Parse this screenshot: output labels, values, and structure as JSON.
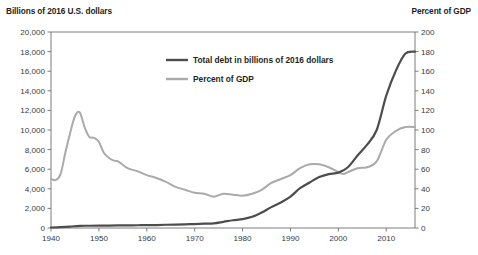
{
  "chart_data": {
    "type": "line",
    "title": "",
    "left_axis_title": "Billions of 2016 U.S. dollars",
    "right_axis_title": "Percent of GDP",
    "xlabel": "",
    "xlim": [
      1940,
      2016
    ],
    "x_ticks": [
      "1940",
      "1950",
      "1960",
      "1970",
      "1980",
      "1990",
      "2000",
      "2010"
    ],
    "x_tick_values": [
      1940,
      1950,
      1960,
      1970,
      1980,
      1990,
      2000,
      2010
    ],
    "left_ylim": [
      0,
      20000
    ],
    "left_ticks": [
      "0",
      "2,000",
      "4,000",
      "6,000",
      "8,000",
      "10,000",
      "12,000",
      "14,000",
      "16,000",
      "18,000",
      "20,000"
    ],
    "left_tick_values": [
      0,
      2000,
      4000,
      6000,
      8000,
      10000,
      12000,
      14000,
      16000,
      18000,
      20000
    ],
    "right_ylim": [
      0,
      200
    ],
    "right_ticks": [
      "0",
      "20",
      "40",
      "60",
      "80",
      "100",
      "120",
      "140",
      "160",
      "180",
      "200"
    ],
    "right_tick_values": [
      0,
      20,
      40,
      60,
      80,
      100,
      120,
      140,
      160,
      180,
      200
    ],
    "grid": false,
    "legend_position": "inside-top-center",
    "series": [
      {
        "name": "Total debt in billions of 2016 dollars",
        "axis": "left",
        "color": "#4d4d4d",
        "x": [
          1940,
          1942,
          1944,
          1946,
          1948,
          1950,
          1952,
          1954,
          1956,
          1958,
          1960,
          1962,
          1964,
          1966,
          1968,
          1970,
          1972,
          1974,
          1976,
          1978,
          1980,
          1982,
          1984,
          1986,
          1988,
          1990,
          1992,
          1994,
          1996,
          1998,
          2000,
          2002,
          2004,
          2006,
          2008,
          2010,
          2012,
          2014,
          2016
        ],
        "values": [
          50,
          90,
          150,
          220,
          230,
          240,
          250,
          260,
          270,
          280,
          290,
          300,
          330,
          350,
          380,
          400,
          440,
          480,
          630,
          790,
          910,
          1140,
          1580,
          2130,
          2600,
          3200,
          4060,
          4650,
          5200,
          5500,
          5650,
          6200,
          7400,
          8500,
          10000,
          13500,
          16050,
          17800,
          18000
        ]
      },
      {
        "name": "Percent of GDP",
        "axis": "right",
        "color": "#aaaaaa",
        "x": [
          1940,
          1941,
          1942,
          1943,
          1944,
          1945,
          1946,
          1947,
          1948,
          1949,
          1950,
          1951,
          1952,
          1953,
          1954,
          1956,
          1958,
          1960,
          1962,
          1964,
          1966,
          1968,
          1970,
          1972,
          1974,
          1976,
          1978,
          1980,
          1982,
          1984,
          1986,
          1988,
          1990,
          1992,
          1994,
          1996,
          1998,
          2000,
          2001,
          2002,
          2004,
          2006,
          2008,
          2010,
          2012,
          2014,
          2016
        ],
        "values": [
          50,
          49,
          55,
          77,
          97,
          114,
          118,
          103,
          93,
          92,
          88,
          77,
          72,
          69,
          68,
          61,
          58,
          54,
          51,
          47,
          42,
          39,
          36,
          35,
          32,
          35,
          34,
          33,
          35,
          39,
          46,
          50,
          54,
          61,
          65,
          65,
          62,
          57,
          55,
          57,
          61,
          62,
          68,
          90,
          99,
          103,
          103
        ]
      }
    ]
  },
  "legend": {
    "items": [
      {
        "label": "Total debt in billions of 2016 dollars",
        "color": "#4d4d4d"
      },
      {
        "label": "Percent of GDP",
        "color": "#aaaaaa"
      }
    ]
  }
}
